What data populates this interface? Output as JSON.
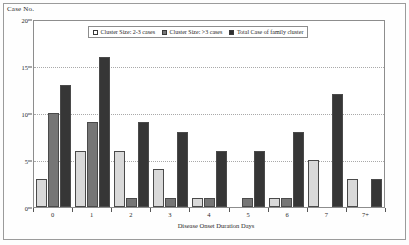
{
  "chart_data": {
    "type": "bar",
    "title": "",
    "xlabel": "Disease Onset Duration Days",
    "ylabel": "Case No.",
    "ylim": [
      0,
      20
    ],
    "yticks": [
      0,
      5,
      10,
      15,
      20
    ],
    "grid": true,
    "legend_position": "top-center",
    "categories": [
      "0",
      "1",
      "2",
      "3",
      "4",
      "5",
      "6",
      "7",
      "7+"
    ],
    "series": [
      {
        "name": "Cluster Size: 2-3 cases",
        "color": "#d9d9d9",
        "values": [
          3,
          6,
          6,
          4,
          1,
          0,
          1,
          5,
          3
        ]
      },
      {
        "name": "Cluster Size: >3 cases",
        "color": "#767676",
        "values": [
          10,
          9,
          1,
          1,
          1,
          1,
          1,
          0,
          0
        ]
      },
      {
        "name": "Total Case of family cluster",
        "color": "#363636",
        "values": [
          13,
          16,
          9,
          8,
          6,
          6,
          8,
          12,
          3
        ]
      }
    ]
  },
  "legend": {
    "items": [
      {
        "label": "Cluster Size: 2-3 cases",
        "swatch": "open-square-swatch"
      },
      {
        "label": "Cluster Size: >3 cases",
        "swatch": "gray-square-swatch"
      },
      {
        "label": "Total Case of family cluster",
        "swatch": "dark-square-swatch"
      }
    ]
  },
  "axes": {
    "y_title": "Case No.",
    "x_title": "Disease Onset Duration Days",
    "y_tick_labels": [
      "0",
      "5",
      "10",
      "15",
      "20"
    ],
    "x_tick_labels": [
      "0",
      "1",
      "2",
      "3",
      "4",
      "5",
      "6",
      "7",
      "7+"
    ]
  }
}
